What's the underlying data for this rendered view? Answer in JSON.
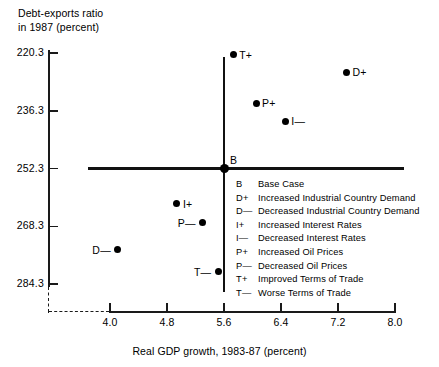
{
  "chart_data": {
    "type": "scatter",
    "title": "",
    "ylabel": "Debt-exports ratio in 1987 (percent)",
    "ylabel_line1": "Debt-exports ratio",
    "ylabel_line2": "in 1987 (percent)",
    "xlabel": "Real GDP growth, 1983-87 (percent)",
    "xlim": [
      4.0,
      8.0
    ],
    "ylim": [
      220.3,
      284.3
    ],
    "y_inverted": true,
    "grid": false,
    "xticks": [
      4.0,
      4.8,
      5.6,
      6.4,
      7.2,
      8.0
    ],
    "xtick_labels": [
      "4.0",
      "4.8",
      "5.6",
      "6.4",
      "7.2",
      "8.0"
    ],
    "yticks": [
      220.3,
      236.3,
      252.3,
      268.3,
      284.3
    ],
    "ytick_labels": [
      "220.3",
      "236.3",
      "252.3",
      "268.3",
      "284.3"
    ],
    "reference_lines": {
      "vertical_x": 5.6,
      "horizontal_y": 252.3
    },
    "points": [
      {
        "key": "B",
        "x": 5.6,
        "y": 252.3,
        "label_side": "right"
      },
      {
        "key": "T+",
        "x": 5.73,
        "y": 220.8,
        "label_side": "right"
      },
      {
        "key": "D+",
        "x": 7.32,
        "y": 225.6,
        "label_side": "right"
      },
      {
        "key": "P+",
        "x": 6.05,
        "y": 234.2,
        "label_side": "right"
      },
      {
        "key": "I—",
        "x": 6.46,
        "y": 239.2,
        "label_side": "right"
      },
      {
        "key": "I+",
        "x": 4.94,
        "y": 262.0,
        "label_side": "right"
      },
      {
        "key": "P—",
        "x": 5.3,
        "y": 267.3,
        "label_side": "left"
      },
      {
        "key": "D—",
        "x": 4.11,
        "y": 274.8,
        "label_side": "left"
      },
      {
        "key": "T—",
        "x": 5.52,
        "y": 280.9,
        "label_side": "left"
      }
    ],
    "legend_position": "inside-lower-right",
    "legend": [
      {
        "key": "B",
        "desc": "Base Case"
      },
      {
        "key": "D+",
        "desc": "Increased Industrial Country Demand"
      },
      {
        "key": "D—",
        "desc": "Decreased Industrial Country Demand"
      },
      {
        "key": "I+",
        "desc": "Increased Interest Rates"
      },
      {
        "key": "I—",
        "desc": "Decreased Interest Rates"
      },
      {
        "key": "P+",
        "desc": "Increased Oil Prices"
      },
      {
        "key": "P—",
        "desc": "Decreased Oil Prices"
      },
      {
        "key": "T+",
        "desc": "Improved Terms of Trade"
      },
      {
        "key": "T—",
        "desc": "Worse Terms of Trade"
      }
    ],
    "colors": {
      "axis": "#1a1a1a",
      "point": "#000000",
      "text": "#000000",
      "background": "#ffffff"
    }
  }
}
